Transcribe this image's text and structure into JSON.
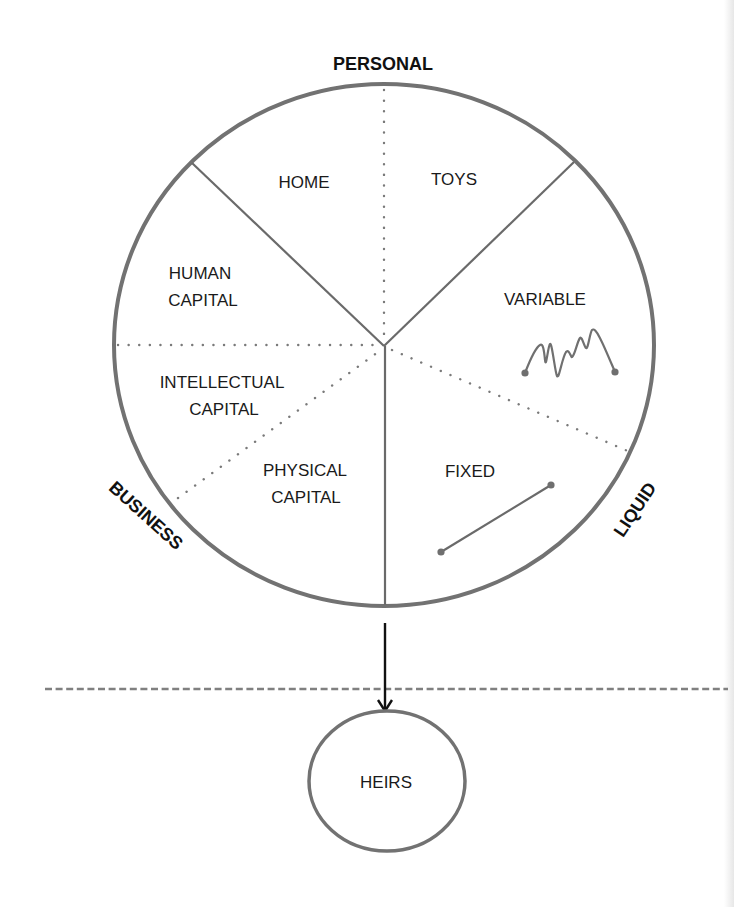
{
  "diagram": {
    "axis_labels": {
      "top": "PERSONAL",
      "left": "BUSINESS",
      "right": "LIQUID"
    },
    "segments": {
      "home": "HOME",
      "toys": "TOYS",
      "variable": "VARIABLE",
      "fixed": "FIXED",
      "human_capital": [
        "HUMAN",
        "CAPITAL"
      ],
      "intellectual_capital": [
        "INTELLECTUAL",
        "CAPITAL"
      ],
      "physical_capital": [
        "PHYSICAL",
        "CAPITAL"
      ]
    },
    "heirs": "HEIRS",
    "icons": {
      "variable": "zigzag-line-icon",
      "fixed": "straight-line-icon"
    },
    "colors": {
      "circle_stroke": "#6e6e6e",
      "spoke": "#6a6a6a",
      "dotted": "#7a7a7a",
      "text": "#1a1a1a",
      "arrow": "#111111",
      "dashed": "#808080"
    }
  }
}
